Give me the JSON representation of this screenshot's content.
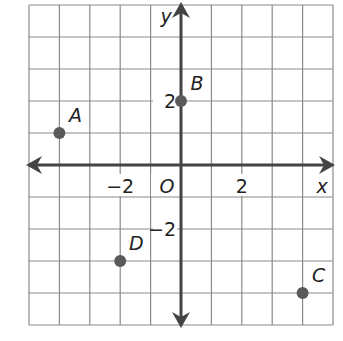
{
  "chart_data": {
    "type": "scatter",
    "title": "",
    "xlabel": "x",
    "ylabel": "y",
    "origin_label": "O",
    "xlim": [
      -5,
      5
    ],
    "ylim": [
      -5,
      5
    ],
    "grid": true,
    "x_ticks": [
      {
        "value": -2,
        "label": "−2"
      },
      {
        "value": 2,
        "label": "2"
      }
    ],
    "y_ticks": [
      {
        "value": 2,
        "label": "2"
      },
      {
        "value": -2,
        "label": "−2"
      }
    ],
    "points": [
      {
        "name": "A",
        "x": -4,
        "y": 1
      },
      {
        "name": "B",
        "x": 0,
        "y": 2
      },
      {
        "name": "C",
        "x": 4,
        "y": -4
      },
      {
        "name": "D",
        "x": -2,
        "y": -3
      }
    ],
    "colors": {
      "grid": "#8a8a8a",
      "axis": "#444444",
      "point": "#5a5a5a",
      "text": "#222222"
    }
  }
}
